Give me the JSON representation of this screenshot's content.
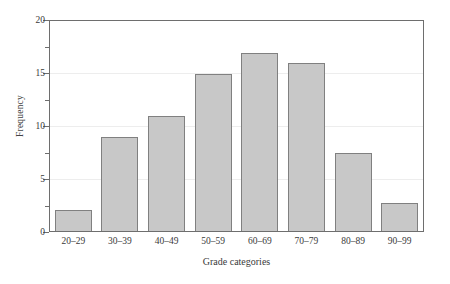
{
  "chart_data": {
    "type": "bar",
    "title": "",
    "subtitle": "",
    "xlabel": "Grade categories",
    "ylabel": "Frequency",
    "categories": [
      "20–29",
      "30–39",
      "40–49",
      "50–59",
      "60–69",
      "70–79",
      "80–89",
      "90–99"
    ],
    "values": [
      2,
      9,
      11,
      15,
      17,
      16,
      7.4,
      2.7
    ],
    "ylim": [
      0,
      20
    ],
    "xlim_note": "categorical",
    "y_major_ticks": [
      0,
      5,
      10,
      15,
      20
    ],
    "y_minor_ticks": [
      2.5,
      7.5,
      12.5,
      17.5
    ],
    "y_tick_labels": [
      "0",
      "5",
      "10",
      "15",
      "20"
    ],
    "grid": "horizontal gridlines at 5, 10, 15",
    "legend": "none",
    "colors": {
      "bar_fill": "#c8c8c8",
      "bar_border": "#808080",
      "axis": "#6e6e6e",
      "gridline": "#ededed",
      "text": "#3a3a3a",
      "background": "#ffffff"
    }
  }
}
